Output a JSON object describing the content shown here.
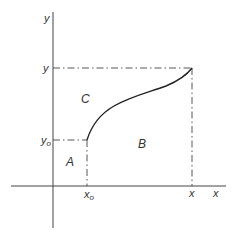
{
  "diagram": {
    "type": "area-under-curve",
    "axes": {
      "x_label": "x",
      "y_label": "y"
    },
    "ticks": {
      "x0": "x",
      "x0_sub": "o",
      "x": "x",
      "y0": "y",
      "y0_sub": "o",
      "y": "y"
    },
    "regions": {
      "A": "A",
      "B": "B",
      "C": "C"
    },
    "colors": {
      "line": "#333333",
      "background": "#ffffff"
    }
  }
}
